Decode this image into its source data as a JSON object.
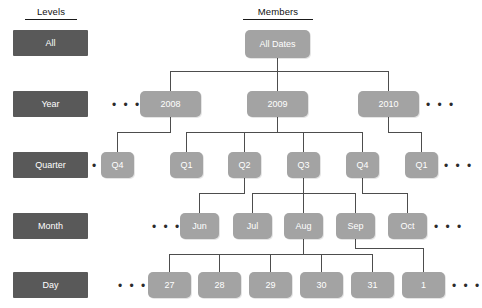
{
  "headers": {
    "levels": "Levels",
    "members": "Members"
  },
  "levels": [
    {
      "label": "All",
      "trailing_dots": false
    },
    {
      "label": "Year",
      "trailing_dots": true
    },
    {
      "label": "Quarter",
      "trailing_dots": true
    },
    {
      "label": "Month",
      "trailing_dots": true
    },
    {
      "label": "Day",
      "trailing_dots": true
    }
  ],
  "rows": {
    "all": {
      "nodes": [
        "All Dates"
      ]
    },
    "year": {
      "nodes": [
        "2008",
        "2009",
        "2010"
      ],
      "lead_dots": true,
      "trail_dots": true
    },
    "quarter": {
      "nodes": [
        "Q4",
        "Q1",
        "Q2",
        "Q3",
        "Q4",
        "Q1"
      ],
      "lead_dots": true,
      "trail_dots": true
    },
    "month": {
      "nodes": [
        "Jun",
        "Jul",
        "Aug",
        "Sep",
        "Oct"
      ],
      "lead_dots": true,
      "trail_dots": true
    },
    "day": {
      "nodes": [
        "27",
        "28",
        "29",
        "30",
        "31",
        "1"
      ],
      "lead_dots": true,
      "trail_dots": true
    }
  },
  "ellipsis": "• • •",
  "colors": {
    "level_box": "#595959",
    "node": "#a3a3a3",
    "connector": "#4d4d4d",
    "text_on_fill": "#ffffff",
    "header_text": "#111111",
    "background": "#ffffff"
  }
}
